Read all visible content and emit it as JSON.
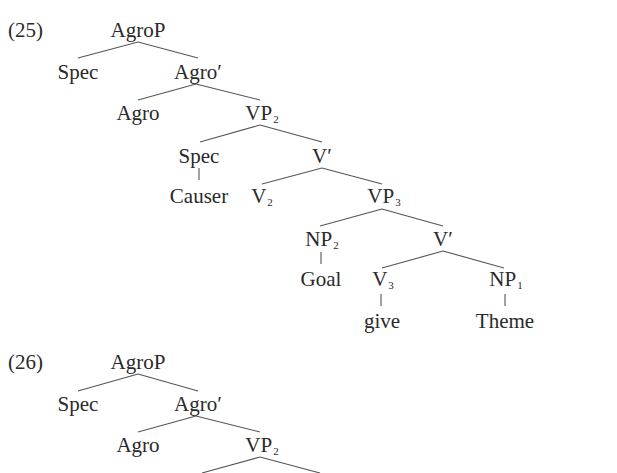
{
  "examples": [
    {
      "number": "(25)",
      "nodes": {
        "agrop": "AgroP",
        "spec1": "Spec",
        "agrobar": "Agro′",
        "agro": "Agro",
        "vp2": "VP",
        "vp2_sub": "2",
        "spec2": "Spec",
        "vbar1": "V′",
        "causer": "Causer",
        "v2": "V",
        "v2_sub": "2",
        "vp3": "VP",
        "vp3_sub": "3",
        "np2": "NP",
        "np2_sub": "2",
        "vbar2": "V′",
        "goal": "Goal",
        "v3": "V",
        "v3_sub": "3",
        "np1": "NP",
        "np1_sub": "1",
        "give": "give",
        "theme": "Theme"
      }
    },
    {
      "number": "(26)",
      "nodes": {
        "agrop": "AgroP",
        "spec1": "Spec",
        "agrobar": "Agro′",
        "agro": "Agro",
        "vp2": "VP",
        "vp2_sub": "2"
      }
    }
  ]
}
